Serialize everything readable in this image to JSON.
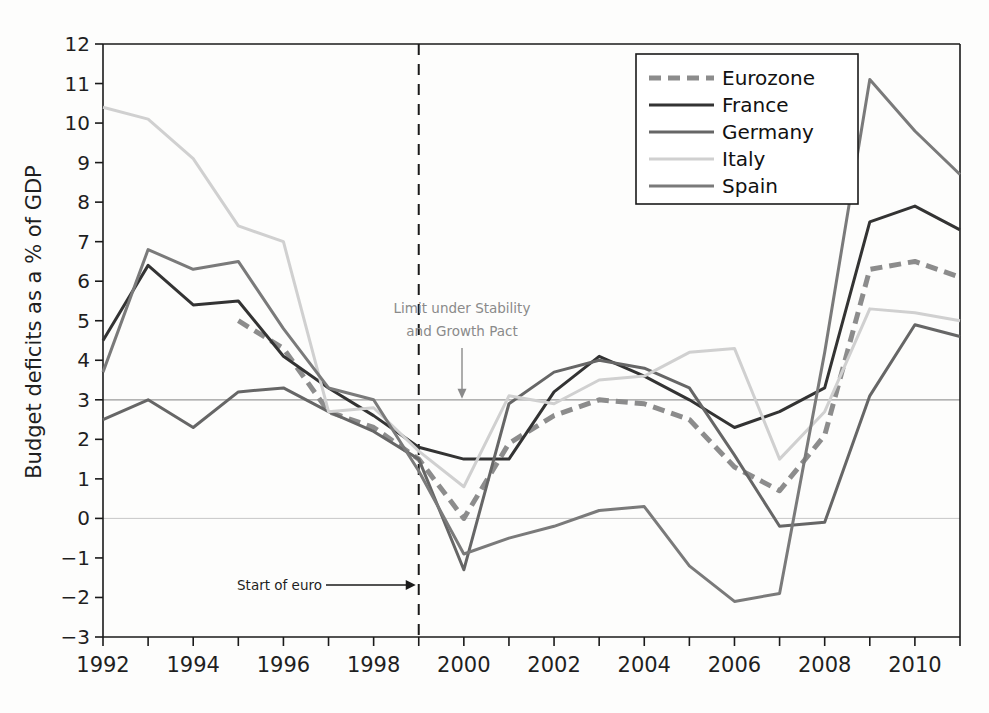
{
  "figure": {
    "cut_title": "",
    "ylabel": "Budget deficits as a % of GDP"
  },
  "annotations": {
    "limit_line1": "Limit under Stability",
    "limit_line2": "and Growth Pact",
    "start_of_euro": "Start of euro"
  },
  "legend": {
    "items": [
      {
        "label": "Eurozone",
        "color": "#8c8c8c",
        "dash": "12 7",
        "width": 5
      },
      {
        "label": "France",
        "color": "#333333",
        "dash": "0",
        "width": 3
      },
      {
        "label": "Germany",
        "color": "#666666",
        "dash": "0",
        "width": 3
      },
      {
        "label": "Italy",
        "color": "#d0d0d0",
        "dash": "0",
        "width": 3
      },
      {
        "label": "Spain",
        "color": "#7a7a7a",
        "dash": "0",
        "width": 3
      }
    ]
  },
  "chart_data": {
    "type": "line",
    "title": "",
    "xlabel": "",
    "ylabel": "Budget deficits as a % of GDP",
    "xlim": [
      1992,
      2011
    ],
    "ylim": [
      -3,
      12
    ],
    "ytick_step": 1,
    "xtick_step": 2,
    "grid": false,
    "reference_lines": [
      {
        "value": 3,
        "label": "Limit under Stability and Growth Pact",
        "color": "#9a9a9a"
      },
      {
        "value": 0,
        "label": "",
        "color": "#c8c8c8"
      }
    ],
    "vertical_marker": {
      "x": 1999,
      "label": "Start of euro",
      "style": "dashed"
    },
    "legend_position": "top-right",
    "x": [
      1992,
      1993,
      1994,
      1995,
      1996,
      1997,
      1998,
      1999,
      2000,
      2001,
      2002,
      2003,
      2004,
      2005,
      2006,
      2007,
      2008,
      2009,
      2010,
      2011
    ],
    "xticks": [
      1992,
      1994,
      1996,
      1998,
      2000,
      2002,
      2004,
      2006,
      2008,
      2010
    ],
    "yticks": [
      12,
      11,
      10,
      9,
      8,
      7,
      6,
      5,
      4,
      3,
      2,
      1,
      0,
      -1,
      -2,
      -3
    ],
    "series": [
      {
        "name": "Eurozone",
        "values": [
          null,
          null,
          null,
          5.0,
          4.3,
          2.7,
          2.3,
          1.5,
          0.0,
          1.9,
          2.6,
          3.0,
          2.9,
          2.5,
          1.3,
          0.7,
          2.1,
          6.3,
          6.5,
          6.1
        ]
      },
      {
        "name": "France",
        "values": [
          4.5,
          6.4,
          5.4,
          5.5,
          4.1,
          3.3,
          2.6,
          1.8,
          1.5,
          1.5,
          3.2,
          4.1,
          3.6,
          3.0,
          2.3,
          2.7,
          3.3,
          7.5,
          7.9,
          7.3
        ]
      },
      {
        "name": "Germany",
        "values": [
          2.5,
          3.0,
          2.3,
          3.2,
          3.3,
          2.7,
          2.2,
          1.5,
          -1.3,
          2.9,
          3.7,
          4.0,
          3.8,
          3.3,
          1.6,
          -0.2,
          -0.1,
          3.1,
          4.9,
          4.6
        ]
      },
      {
        "name": "Italy",
        "values": [
          10.4,
          10.1,
          9.1,
          7.4,
          7.0,
          2.7,
          2.8,
          1.7,
          0.8,
          3.1,
          2.9,
          3.5,
          3.6,
          4.2,
          4.3,
          1.5,
          2.7,
          5.3,
          5.2,
          5.0
        ]
      },
      {
        "name": "Spain",
        "values": [
          3.7,
          6.8,
          6.3,
          6.5,
          4.8,
          3.3,
          3.0,
          1.2,
          -0.9,
          -0.5,
          -0.2,
          0.2,
          0.3,
          -1.2,
          -2.1,
          -1.9,
          4.2,
          11.1,
          9.8,
          8.7
        ]
      }
    ]
  }
}
